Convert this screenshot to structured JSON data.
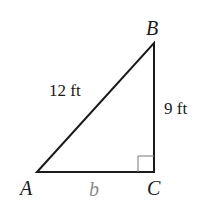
{
  "diagram": {
    "type": "right-triangle",
    "vertices": {
      "A": {
        "label": "A",
        "x": 37,
        "y": 172
      },
      "B": {
        "label": "B",
        "x": 154,
        "y": 43
      },
      "C": {
        "label": "C",
        "x": 154,
        "y": 172
      }
    },
    "sides": {
      "hypotenuse_AB": {
        "label": "12 ft"
      },
      "leg_BC": {
        "label": "9 ft"
      },
      "leg_AC": {
        "label": "b"
      }
    },
    "right_angle_at": "C",
    "colors": {
      "stroke": "#1a1a1a",
      "text": "#1a1a1a",
      "unknown_label": "#8a8a8a",
      "right_angle_marker": "#777777"
    }
  }
}
